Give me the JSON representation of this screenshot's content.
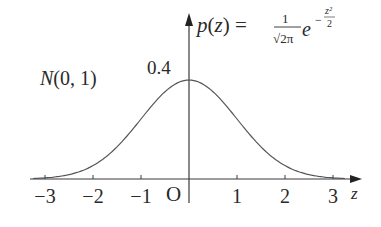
{
  "chart_data": {
    "type": "line",
    "title": "N(0, 1)",
    "formula": {
      "lhs": "p(z) =",
      "frac_num": "1",
      "frac_den": "√2π",
      "base": "e",
      "exp_sign": "−",
      "exp_num": "z²",
      "exp_den": "2"
    },
    "xlabel": "z",
    "ylabel": "p(z)",
    "origin_label": "O",
    "peak_label": "0.4",
    "x_ticks": [
      -3,
      -2,
      -1,
      1,
      2,
      3
    ],
    "x_tick_labels": [
      "−3",
      "−2",
      "−1",
      "1",
      "2",
      "3"
    ],
    "xlim": [
      -3.4,
      3.8
    ],
    "ylim": [
      0,
      0.66
    ],
    "series": [
      {
        "name": "standard normal density",
        "mean": 0,
        "std": 1,
        "x": [
          -3.5,
          -3,
          -2.5,
          -2,
          -1.5,
          -1,
          -0.5,
          0,
          0.5,
          1,
          1.5,
          2,
          2.5,
          3,
          3.5
        ],
        "y": [
          0.0009,
          0.0044,
          0.0175,
          0.054,
          0.1295,
          0.242,
          0.3521,
          0.3989,
          0.3521,
          0.242,
          0.1295,
          0.054,
          0.0175,
          0.0044,
          0.0009
        ]
      }
    ],
    "grid": false,
    "legend": "none"
  },
  "colors": {
    "axis": "#3a3a3a",
    "curve": "#555555",
    "text": "#2a2a2a"
  }
}
